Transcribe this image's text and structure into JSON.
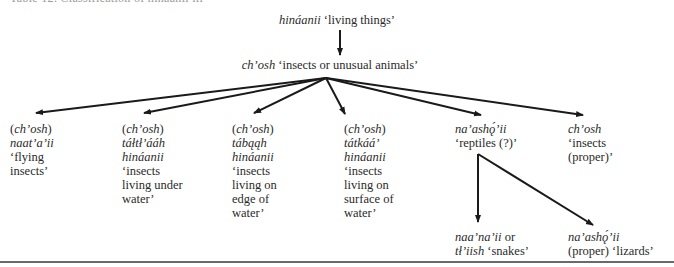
{
  "caption": "Table 12.  Classification of hináanii iii",
  "root": {
    "term": "hináanii",
    "gloss": "‘living things’"
  },
  "level1": {
    "term": "ch’osh",
    "gloss": "‘insects or unusual animals’"
  },
  "children": [
    {
      "lines": [
        {
          "t": "(",
          "i": false
        },
        {
          "t": "ch’osh",
          "i": true
        },
        {
          "t": ")",
          "i": false
        }
      ],
      "rows": [
        {
          "text": "naat’a’ii",
          "italic": true
        },
        {
          "text": "‘flying",
          "italic": false
        },
        {
          "text": "insects’",
          "italic": false
        }
      ]
    },
    {
      "lines": [
        {
          "t": "(",
          "i": false
        },
        {
          "t": "ch’osh",
          "i": true
        },
        {
          "t": ")",
          "i": false
        }
      ],
      "rows": [
        {
          "text": "táłtł’ááh",
          "italic": true
        },
        {
          "text": "hináanii",
          "italic": true
        },
        {
          "text": "‘insects",
          "italic": false
        },
        {
          "text": "living under",
          "italic": false
        },
        {
          "text": "water’",
          "italic": false
        }
      ]
    },
    {
      "lines": [
        {
          "t": "(",
          "i": false
        },
        {
          "t": "ch’osh",
          "i": true
        },
        {
          "t": ")",
          "i": false
        }
      ],
      "rows": [
        {
          "text": "tábąąh",
          "italic": true
        },
        {
          "text": "hináanii",
          "italic": true
        },
        {
          "text": "‘insects",
          "italic": false
        },
        {
          "text": "living on",
          "italic": false
        },
        {
          "text": "edge of",
          "italic": false
        },
        {
          "text": "water’",
          "italic": false
        }
      ]
    },
    {
      "lines": [
        {
          "t": "(",
          "i": false
        },
        {
          "t": "ch’osh",
          "i": true
        },
        {
          "t": ")",
          "i": false
        }
      ],
      "rows": [
        {
          "text": "tátkáá’",
          "italic": true
        },
        {
          "text": "hináanii",
          "italic": true
        },
        {
          "text": "‘insects",
          "italic": false
        },
        {
          "text": "living on",
          "italic": false
        },
        {
          "text": "surface of",
          "italic": false
        },
        {
          "text": "water’",
          "italic": false
        }
      ]
    },
    {
      "rows": [
        {
          "text": "na’ashǫ́’ii",
          "italic": true
        },
        {
          "text": "‘reptiles (?)’",
          "italic": false
        }
      ]
    },
    {
      "rows": [
        {
          "text": "ch’osh",
          "italic": true
        },
        {
          "text": "‘insects",
          "italic": false
        },
        {
          "text": "(proper)’",
          "italic": false
        }
      ]
    }
  ],
  "reptile_children": [
    {
      "term": "naa’na’ii",
      "conj": " or",
      "term2": "tł’iish",
      "gloss": " ‘snakes’"
    },
    {
      "term": "na’ashǫ́’ii",
      "gloss2": "(proper) ‘lizards’"
    }
  ],
  "colors": {
    "text": "#2a2a2a",
    "arrow": "#1a1a1a",
    "rule": "#6a6a6a"
  }
}
